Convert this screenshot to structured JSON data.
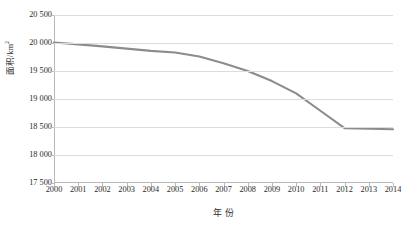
{
  "chart_data": {
    "type": "line",
    "title": "",
    "subtitle": "",
    "xlabel": "年 份",
    "ylabel": "面积/km2",
    "ylabel_base": "面积/km",
    "ylabel_exponent": "2",
    "x": [
      2000,
      2001,
      2002,
      2003,
      2004,
      2005,
      2006,
      2007,
      2008,
      2009,
      2010,
      2011,
      2012,
      2013,
      2014
    ],
    "categories": [
      "2000",
      "2001",
      "2002",
      "2003",
      "2004",
      "2005",
      "2006",
      "2007",
      "2008",
      "2009",
      "2010",
      "2011",
      "2012",
      "2013",
      "2014"
    ],
    "values": [
      20010,
      19975,
      19940,
      19900,
      19860,
      19830,
      19760,
      19640,
      19500,
      19320,
      19100,
      18790,
      18480,
      18470,
      18460
    ],
    "series": [
      {
        "name": "面积",
        "color": "#8c8c8c",
        "values": [
          20010,
          19975,
          19940,
          19900,
          19860,
          19830,
          19760,
          19640,
          19500,
          19320,
          19100,
          18790,
          18480,
          18470,
          18460
        ]
      }
    ],
    "ylim": [
      17500,
      20500
    ],
    "ytick_step": 500,
    "ytick_values": [
      20500,
      20000,
      19500,
      19000,
      18500,
      18000,
      17500
    ],
    "ytick_labels": [
      "20 500",
      "20 000",
      "19 500",
      "19 000",
      "18 500",
      "18 000",
      "17 500"
    ],
    "grid": true,
    "grid_axis": "y",
    "legend": false,
    "legend_position": "none",
    "line_color": "#8c8c8c",
    "grid_color": "#dcdcdc",
    "axis_color": "#b9b9b9",
    "text_color": "#2b2b2b",
    "background": "#ffffff",
    "markers": false
  }
}
